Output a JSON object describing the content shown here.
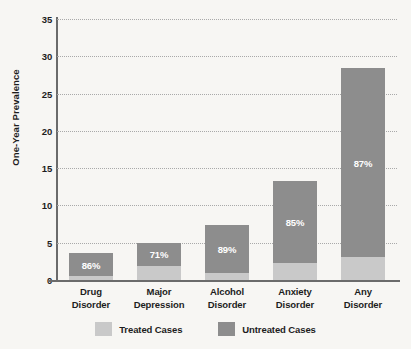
{
  "chart_data": {
    "type": "bar",
    "subtype": "stacked-bar",
    "title": "",
    "xlabel": "",
    "ylabel": "One-Year Prevalence",
    "ylim": [
      0,
      35
    ],
    "yticks": [
      0,
      5,
      10,
      15,
      20,
      25,
      30,
      35
    ],
    "grid": "horizontal-dotted",
    "legend_position": "bottom-center",
    "categories": [
      "Drug Disorder",
      "Major Depression",
      "Alcohol Disorder",
      "Anxiety Disorder",
      "Any Disorder"
    ],
    "category_lines": [
      [
        "Drug",
        "Disorder"
      ],
      [
        "Major",
        "Depression"
      ],
      [
        "Alcohol",
        "Disorder"
      ],
      [
        "Anxiety",
        "Disorder"
      ],
      [
        "Any",
        "Disorder"
      ]
    ],
    "series": [
      {
        "name": "Treated Cases",
        "color": "#c9c9c9",
        "values": [
          0.5,
          1.9,
          0.9,
          2.3,
          3.1
        ]
      },
      {
        "name": "Untreated Cases",
        "color": "#8d8d8d",
        "values": [
          3.1,
          3.1,
          6.5,
          11.0,
          25.3
        ]
      }
    ],
    "totals": [
      3.6,
      5.0,
      7.4,
      13.3,
      28.4
    ],
    "annotations": [
      "86%",
      "71%",
      "89%",
      "85%",
      "87%"
    ],
    "annotation_meaning": "percentage of cases untreated"
  },
  "axis": {
    "y_label": "One-Year Prevalence",
    "y_tick_labels": [
      "0",
      "5",
      "10",
      "15",
      "20",
      "25",
      "30",
      "35"
    ]
  },
  "legend": {
    "items": [
      {
        "label": "Treated Cases",
        "color": "#c9c9c9"
      },
      {
        "label": "Untreated Cases",
        "color": "#8d8d8d"
      }
    ]
  },
  "colors": {
    "treated": "#c9c9c9",
    "untreated": "#8d8d8d",
    "axis": "#6b6b6b",
    "grid": "#a9a9a9",
    "background": "#f7f6f3",
    "text": "#1d1d1d",
    "annotation_text": "#ffffff"
  }
}
